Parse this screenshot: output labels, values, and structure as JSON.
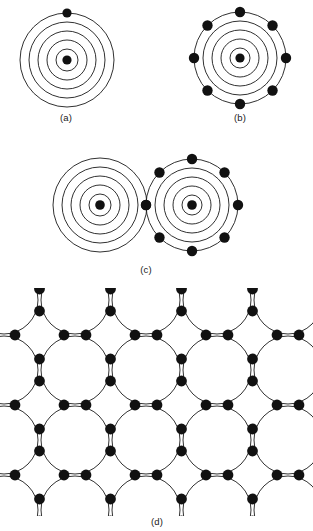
{
  "figure": {
    "type": "scientific-diagram",
    "background_color": "#ffffff",
    "ink_color": "#111111",
    "width": 313,
    "height": 531
  },
  "panels": [
    {
      "id": "a",
      "caption": "(a)",
      "caption_x": 66,
      "caption_y": 114,
      "description": "single atom with four concentric electron shells and one outer-shell electron",
      "center": {
        "x": 67,
        "y": 60
      },
      "shell_radii": [
        11,
        20,
        29,
        38,
        47
      ],
      "shell_count": 4,
      "nucleus_radius": 4.6,
      "valence_electron_count": 1,
      "electron_radius": 4.6,
      "electron_angles_deg": [
        0
      ]
    },
    {
      "id": "b",
      "caption": "(b)",
      "caption_x": 240,
      "caption_y": 114,
      "description": "single atom with four concentric electron shells and eight outer-shell electrons",
      "center": {
        "x": 240,
        "y": 58
      },
      "shell_radii": [
        10,
        19,
        28,
        37,
        46
      ],
      "shell_count": 4,
      "nucleus_radius": 4.6,
      "valence_electron_count": 8,
      "electron_radius": 5.2,
      "electron_angles_deg": [
        0,
        45,
        90,
        135,
        180,
        225,
        270,
        315
      ]
    },
    {
      "id": "c",
      "caption": "(c)",
      "caption_x": 146,
      "caption_y": 266,
      "description": "two adjacent atoms in contact, the right atom carrying eight outer electrons and one shared electron at the contact point",
      "left_atom": {
        "center": {
          "x": 100,
          "y": 205
        },
        "shell_radii": [
          11,
          20,
          29,
          38,
          47
        ],
        "shell_count": 4,
        "nucleus_radius": 4.8,
        "valence_electron_count": 0
      },
      "right_atom": {
        "center": {
          "x": 192,
          "y": 205
        },
        "shell_radii": [
          10,
          19,
          28,
          37,
          46
        ],
        "shell_count": 4,
        "nucleus_radius": 4.8,
        "valence_electron_count": 8,
        "electron_radius": 5.2,
        "electron_angles_deg": [
          0,
          45,
          90,
          135,
          180,
          225,
          270,
          315
        ]
      },
      "shared_electron": {
        "x": 146,
        "y": 205,
        "radius": 5.2
      }
    },
    {
      "id": "d",
      "caption": "(d)",
      "caption_x": 157,
      "caption_y": 519,
      "description": "extended two-dimensional covalent lattice of overlapping atomic shells with paired bonding electrons between neighbouring atoms",
      "lattice": {
        "origin": {
          "x": 4,
          "y": 300
        },
        "spacing_x": 71,
        "spacing_y": 70,
        "columns": 5,
        "rows": 4,
        "atom_radius": 34,
        "electron_radius": 5.4,
        "pair_offset": 11
      }
    }
  ]
}
